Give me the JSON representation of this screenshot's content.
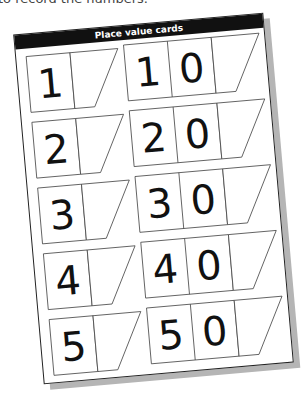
{
  "caption": "to record the numbers.",
  "sheet": {
    "title": "Place value cards",
    "left_cards": [
      {
        "digits": [
          "1"
        ]
      },
      {
        "digits": [
          "2"
        ]
      },
      {
        "digits": [
          "3"
        ]
      },
      {
        "digits": [
          "4"
        ]
      },
      {
        "digits": [
          "5"
        ]
      }
    ],
    "right_cards": [
      {
        "digits": [
          "1",
          "0"
        ]
      },
      {
        "digits": [
          "2",
          "0"
        ]
      },
      {
        "digits": [
          "3",
          "0"
        ]
      },
      {
        "digits": [
          "4",
          "0"
        ]
      },
      {
        "digits": [
          "5",
          "0"
        ]
      }
    ]
  }
}
